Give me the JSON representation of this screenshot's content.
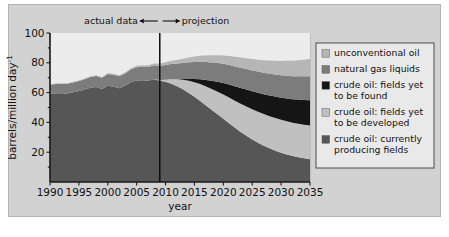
{
  "figure": {
    "background_color": "#d2d2d2",
    "plot_background_color": "#ececed"
  },
  "annotations": {
    "actual_label": "actual data",
    "projection_label": "projection",
    "divider_year": 2009
  },
  "axis": {
    "x_title": "year",
    "y_title_main": "barrels/million day",
    "y_title_exponent": "-1",
    "x_ticks": [
      "1990",
      "1995",
      "2000",
      "2005",
      "2010",
      "2015",
      "2020",
      "2025",
      "2030",
      "2035"
    ],
    "y_ticks": [
      "20",
      "40",
      "60",
      "80",
      "100"
    ]
  },
  "legend": {
    "items": [
      {
        "label": "unconventional oil",
        "color": "#b6b6b6",
        "key": "unconventional-oil"
      },
      {
        "label": "natural gas liquids",
        "color": "#7c7c7c",
        "key": "natural-gas-liquids"
      },
      {
        "label": "crude oil: fields yet to be found",
        "color": "#151515",
        "key": "crude-oil-yet-to-be-found"
      },
      {
        "label": "crude oil: fields yet to be developed",
        "color": "#c0c0c0",
        "key": "crude-oil-yet-to-be-developed"
      },
      {
        "label": "crude oil: currently producing fields",
        "color": "#565656",
        "key": "crude-oil-currently-producing"
      }
    ]
  },
  "chart_data": {
    "type": "area",
    "title": "",
    "subtitle": "",
    "xlabel": "year",
    "ylabel": "barrels/million day^-1",
    "xlim": [
      1990,
      2035
    ],
    "ylim": [
      0,
      100
    ],
    "grid": true,
    "legend_position": "right",
    "stacked": true,
    "x": [
      1990,
      1991,
      1992,
      1993,
      1994,
      1995,
      1996,
      1997,
      1998,
      1999,
      2000,
      2001,
      2002,
      2003,
      2004,
      2005,
      2006,
      2007,
      2008,
      2009,
      2010,
      2011,
      2012,
      2013,
      2014,
      2015,
      2016,
      2017,
      2018,
      2019,
      2020,
      2021,
      2022,
      2023,
      2024,
      2025,
      2026,
      2027,
      2028,
      2029,
      2030,
      2031,
      2032,
      2033,
      2034,
      2035
    ],
    "series": [
      {
        "name": "crude oil: currently producing fields",
        "color": "#565656",
        "values": [
          59.0,
          59.5,
          59.6,
          59.4,
          60.2,
          61.0,
          62.0,
          63.2,
          63.8,
          62.4,
          64.6,
          64.0,
          63.0,
          64.6,
          67.0,
          68.2,
          68.3,
          68.0,
          68.9,
          68.0,
          67.3,
          66.0,
          64.2,
          62.2,
          59.8,
          57.2,
          54.4,
          51.4,
          48.4,
          45.4,
          42.4,
          39.4,
          36.4,
          33.6,
          31.0,
          28.6,
          26.4,
          24.4,
          22.6,
          21.0,
          19.6,
          18.4,
          17.4,
          16.6,
          15.9,
          15.3
        ]
      },
      {
        "name": "crude oil: fields yet to be developed",
        "color": "#c0c0c0",
        "values": [
          0,
          0,
          0,
          0,
          0,
          0,
          0,
          0,
          0,
          0,
          0,
          0,
          0,
          0,
          0,
          0,
          0,
          0,
          0,
          0.4,
          1.4,
          3.0,
          4.8,
          6.5,
          8.2,
          9.8,
          11.3,
          12.7,
          14.0,
          15.2,
          16.3,
          17.3,
          18.2,
          19.0,
          19.7,
          20.3,
          20.8,
          21.2,
          21.6,
          21.9,
          22.1,
          22.3,
          22.4,
          22.5,
          22.6,
          22.6
        ]
      },
      {
        "name": "crude oil: fields yet to be found",
        "color": "#151515",
        "values": [
          0,
          0,
          0,
          0,
          0,
          0,
          0,
          0,
          0,
          0,
          0,
          0,
          0,
          0,
          0,
          0,
          0,
          0,
          0,
          0,
          0,
          0,
          0,
          0.4,
          1.2,
          2.2,
          3.3,
          4.4,
          5.5,
          6.6,
          7.7,
          8.7,
          9.6,
          10.5,
          11.3,
          12.0,
          12.7,
          13.3,
          13.9,
          14.4,
          14.9,
          15.4,
          15.8,
          16.2,
          16.6,
          17.0
        ]
      },
      {
        "name": "natural gas liquids",
        "color": "#7c7c7c",
        "values": [
          6.2,
          6.3,
          6.4,
          6.5,
          6.6,
          6.8,
          7.0,
          7.2,
          7.4,
          7.5,
          7.8,
          7.9,
          8.0,
          8.2,
          8.5,
          8.8,
          9.0,
          9.2,
          9.4,
          9.6,
          9.9,
          10.2,
          10.5,
          10.8,
          11.1,
          11.4,
          11.7,
          12.0,
          12.3,
          12.6,
          12.9,
          13.1,
          13.4,
          13.6,
          13.8,
          14.0,
          14.2,
          14.4,
          14.6,
          14.8,
          15.0,
          15.2,
          15.4,
          15.6,
          15.8,
          16.0
        ]
      },
      {
        "name": "unconventional oil",
        "color": "#b6b6b6",
        "values": [
          0.3,
          0.3,
          0.3,
          0.4,
          0.4,
          0.4,
          0.5,
          0.5,
          0.5,
          0.6,
          0.6,
          0.7,
          0.7,
          0.8,
          0.9,
          1.0,
          1.1,
          1.2,
          1.3,
          1.5,
          1.8,
          2.1,
          2.4,
          2.8,
          3.2,
          3.6,
          4.0,
          4.4,
          4.8,
          5.2,
          5.6,
          6.0,
          6.4,
          6.8,
          7.2,
          7.6,
          8.0,
          8.4,
          8.8,
          9.2,
          9.6,
          10.0,
          10.4,
          10.8,
          11.2,
          11.6
        ]
      }
    ]
  }
}
